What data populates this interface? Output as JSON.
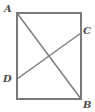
{
  "figure": {
    "background_color": "#ffffff",
    "stroke_color": "#7a7a7a",
    "label_color": "#4d4d4d",
    "stroke_width": 1.4,
    "labels": {
      "a": "A",
      "b": "B",
      "c": "C",
      "d": "D"
    },
    "points": {
      "A": {
        "x": 17,
        "y": 13
      },
      "B": {
        "x": 81,
        "y": 99
      },
      "C": {
        "x": 81,
        "y": 33
      },
      "D": {
        "x": 17,
        "y": 79
      },
      "top_right_corner": {
        "x": 81,
        "y": 13
      },
      "bottom_left_corner": {
        "x": 17,
        "y": 99
      },
      "intersection": {
        "x": 49,
        "y": 58
      }
    },
    "rectangle": {
      "x": 17,
      "y": 13,
      "width": 64,
      "height": 86
    },
    "segments": [
      {
        "name": "diagonal-AB",
        "from": "A",
        "to": "B"
      },
      {
        "name": "segment-DC",
        "from": "D",
        "to": "C"
      }
    ]
  }
}
